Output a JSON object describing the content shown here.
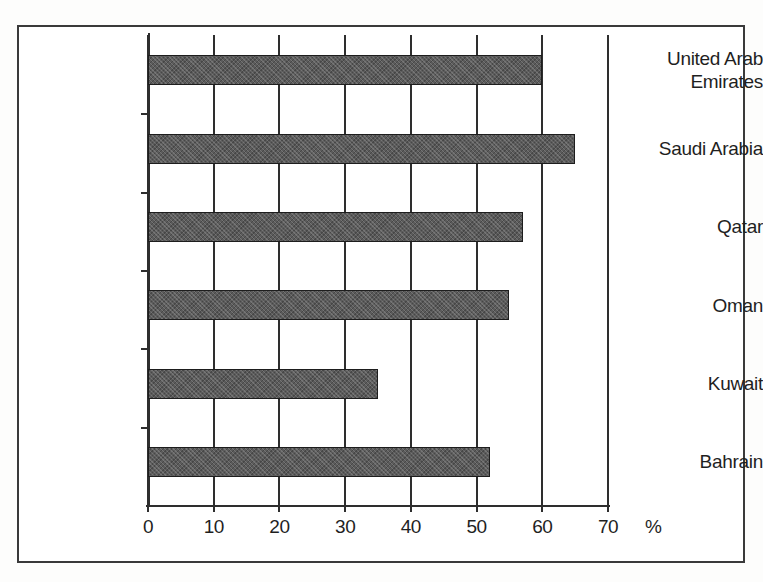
{
  "chart_data": {
    "type": "bar",
    "orientation": "horizontal",
    "title": "",
    "subtitle": "",
    "xlabel": "%",
    "ylabel": "",
    "categories": [
      "Bahrain",
      "Kuwait",
      "Oman",
      "Qatar",
      "Saudi Arabia",
      "United Arab Emirates"
    ],
    "values": [
      52,
      35,
      55,
      57,
      65,
      60
    ],
    "xlim": [
      0,
      70
    ],
    "xticks": [
      0,
      10,
      20,
      30,
      40,
      50,
      60,
      70
    ],
    "xtick_labels": [
      "0",
      "10",
      "20",
      "30",
      "40",
      "50",
      "60",
      "70"
    ],
    "grid": true,
    "grid_axis": "x",
    "legend": false,
    "legend_position": "none",
    "bar_color": "#5b5b5b",
    "bar_edge_color": "#1d1d1d",
    "axis_color": "#2e2e2e",
    "background_color": "#ffffff",
    "series": [
      {
        "name": "",
        "points": [
          {
            "category": "United Arab Emirates",
            "label_lines": [
              "United Arab",
              "Emirates"
            ],
            "value": 60
          },
          {
            "category": "Saudi Arabia",
            "label_lines": [
              "Saudi Arabia"
            ],
            "value": 65
          },
          {
            "category": "Qatar",
            "label_lines": [
              "Qatar"
            ],
            "value": 57
          },
          {
            "category": "Oman",
            "label_lines": [
              "Oman"
            ],
            "value": 55
          },
          {
            "category": "Kuwait",
            "label_lines": [
              "Kuwait"
            ],
            "value": 35
          },
          {
            "category": "Bahrain",
            "label_lines": [
              "Bahrain"
            ],
            "value": 52
          }
        ]
      }
    ]
  },
  "axis_unit": "%"
}
